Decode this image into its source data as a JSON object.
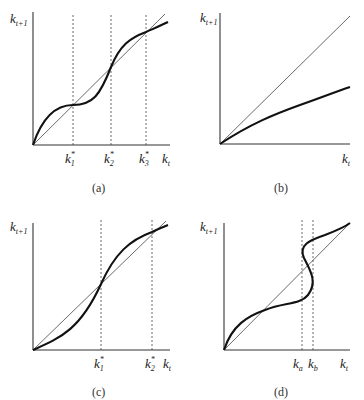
{
  "figure": {
    "panels": [
      {
        "id": "a",
        "caption": "(a)",
        "y_label": "k",
        "y_label_sub": "t+1",
        "x_label": "k",
        "x_label_sub": "t",
        "markers": [
          {
            "label": "k",
            "sup": "*",
            "sub": "1"
          },
          {
            "label": "k",
            "sup": "*",
            "sub": "2"
          },
          {
            "label": "k",
            "sup": "*",
            "sub": "3"
          }
        ]
      },
      {
        "id": "b",
        "caption": "(b)",
        "y_label": "k",
        "y_label_sub": "t+1",
        "x_label": "k",
        "x_label_sub": "t",
        "markers": []
      },
      {
        "id": "c",
        "caption": "(c)",
        "y_label": "k",
        "y_label_sub": "t+1",
        "x_label": "k",
        "x_label_sub": "t",
        "markers": [
          {
            "label": "k",
            "sup": "*",
            "sub": "1"
          },
          {
            "label": "k",
            "sup": "*",
            "sub": "2"
          }
        ]
      },
      {
        "id": "d",
        "caption": "(d)",
        "y_label": "k",
        "y_label_sub": "t+1",
        "x_label": "k",
        "x_label_sub": "t",
        "markers": [
          {
            "label": "k",
            "sub": "a"
          },
          {
            "label": "k",
            "sub": "b"
          }
        ]
      }
    ]
  }
}
